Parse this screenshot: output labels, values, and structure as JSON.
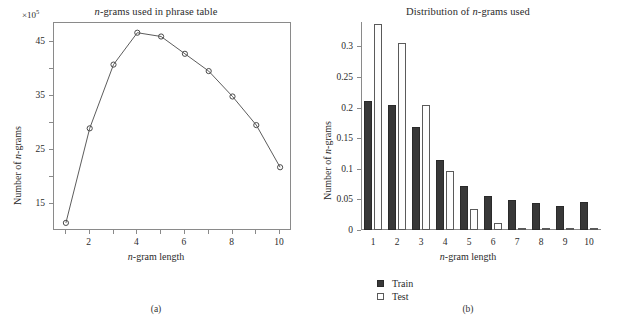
{
  "figure": {
    "panel_a_caption": "(a)",
    "panel_b_caption": "(b)"
  },
  "chart_data": [
    {
      "id": "panel-a",
      "type": "line",
      "title": "n-grams used in phrase table",
      "xlabel": "n-gram length",
      "ylabel": "Number of n-grams",
      "y_exponent_label": "×10",
      "y_exponent_value": "5",
      "y_scale_factor": 100000,
      "grid": false,
      "legend": "none",
      "marker": "open-circle",
      "xlim": [
        0.5,
        10.5
      ],
      "ylim": [
        10.0,
        48.5
      ],
      "x_ticks": [
        1,
        2,
        3,
        4,
        5,
        6,
        7,
        8,
        9,
        10
      ],
      "x_tick_labels": [
        "",
        "2",
        "",
        "4",
        "",
        "6",
        "",
        "8",
        "",
        "10"
      ],
      "y_ticks": [
        15,
        20,
        25,
        30,
        35,
        40,
        45
      ],
      "y_tick_labels": [
        "15",
        "",
        "25",
        "",
        "35",
        "",
        "45"
      ],
      "x": [
        1,
        2,
        3,
        4,
        5,
        6,
        7,
        8,
        9,
        10
      ],
      "values": [
        11.5,
        29.0,
        40.8,
        46.7,
        46.0,
        42.8,
        39.6,
        34.9,
        29.6,
        21.8
      ]
    },
    {
      "id": "panel-b",
      "type": "bar",
      "title": "Distribution of n-grams used",
      "xlabel": "n-gram length",
      "ylabel": "Number of n-grams",
      "grid": false,
      "legend": "bottom-left",
      "ylim": [
        0,
        0.34
      ],
      "categories": [
        "1",
        "2",
        "3",
        "4",
        "5",
        "6",
        "7",
        "8",
        "9",
        "10"
      ],
      "y_ticks": [
        0,
        0.05,
        0.1,
        0.15,
        0.2,
        0.25,
        0.3
      ],
      "y_tick_labels": [
        "0",
        "0.05",
        "0.1",
        "0.15",
        "0.2",
        "0.25",
        "0.3"
      ],
      "series": [
        {
          "name": "Train",
          "style": "filled",
          "values": [
            0.211,
            0.205,
            0.168,
            0.115,
            0.072,
            0.056,
            0.049,
            0.044,
            0.039,
            0.045
          ]
        },
        {
          "name": "Test",
          "style": "open",
          "values": [
            0.337,
            0.305,
            0.205,
            0.097,
            0.035,
            0.012,
            0.002,
            0.001,
            0.0,
            0.0
          ]
        }
      ]
    }
  ]
}
